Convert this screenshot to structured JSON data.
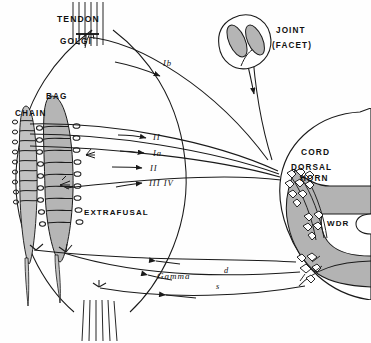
{
  "figure": {
    "type": "anatomical-schematic",
    "background_color": "#fefefe",
    "ink_color": "#1a1a1a",
    "fill_gray": "#b5b5b5",
    "fill_gray_light": "#c9c9c9",
    "fill_cord_gray": "#b3b3b3"
  },
  "labels": {
    "tendon": "TENDON",
    "golgi": "GOLGI",
    "bag": "BAG",
    "chain": "CHAIN",
    "extrafusal": "EXTRAFUSAL",
    "joint": "JOINT",
    "facet": "(FACET)",
    "cord": "CORD",
    "dorsal": "DORSAL",
    "horn": "HORN",
    "wdr": "WDR",
    "gamma": "Gamma"
  },
  "afferents": [
    {
      "id": "Ib",
      "label": "Ib",
      "source": "golgi-tendon-organ",
      "x": 147,
      "y": 62
    },
    {
      "id": "II-upper",
      "label": "II",
      "source": "spindle-secondary",
      "x": 153,
      "y": 140
    },
    {
      "id": "Ia",
      "label": "Ia",
      "source": "spindle-primary",
      "x": 153,
      "y": 155
    },
    {
      "id": "II-lower",
      "label": "II",
      "source": "spindle-secondary",
      "x": 153,
      "y": 169
    },
    {
      "id": "III-IV",
      "label": "III IV",
      "source": "free-nerve-endings",
      "x": 150,
      "y": 185
    }
  ],
  "efferents": [
    {
      "id": "gamma-d",
      "label": "d",
      "name": "gamma-dynamic",
      "x": 224,
      "y": 273
    },
    {
      "id": "gamma-s",
      "label": "s",
      "name": "gamma-static",
      "x": 216,
      "y": 288
    }
  ],
  "structures": [
    {
      "name": "muscle-belly",
      "note": "extrafusal muscle outline"
    },
    {
      "name": "intrafusal-bag-fiber",
      "note": "nuclear bag fiber"
    },
    {
      "name": "intrafusal-chain-fiber",
      "note": "nuclear chain fiber"
    },
    {
      "name": "golgi-tendon-organ",
      "note": "at myotendinous junction"
    },
    {
      "name": "joint-facet",
      "note": "facet joint inset, top right"
    },
    {
      "name": "spinal-cord",
      "note": "transverse hemisection, right"
    },
    {
      "name": "dorsal-horn",
      "note": "laminae with interneurons"
    },
    {
      "name": "wdr-neuron-cluster",
      "note": "wide dynamic range neurons"
    },
    {
      "name": "ventral-horn",
      "note": "motoneuron pool"
    }
  ]
}
